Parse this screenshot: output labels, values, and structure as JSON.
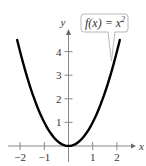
{
  "chart_data": {
    "type": "line",
    "title": "",
    "xlabel": "x",
    "ylabel": "y",
    "xlim": [
      -2.4,
      2.6
    ],
    "ylim": [
      0,
      4.6
    ],
    "x_ticks": [
      -2,
      -1,
      1,
      2
    ],
    "x_tick_labels": [
      "−2",
      "−1",
      "1",
      "2"
    ],
    "y_ticks": [
      1,
      2,
      3,
      4
    ],
    "y_tick_labels": [
      "1",
      "2",
      "3",
      "4"
    ],
    "grid": false,
    "series": [
      {
        "name": "f(x) = x^2",
        "function": "x^2",
        "x_range": [
          -2.12,
          2.12
        ],
        "color": "#000000"
      }
    ],
    "annotations": [
      {
        "text_main": "f(x) = x",
        "superscript": "2",
        "points_to": [
          1.9,
          3.6
        ]
      }
    ]
  }
}
